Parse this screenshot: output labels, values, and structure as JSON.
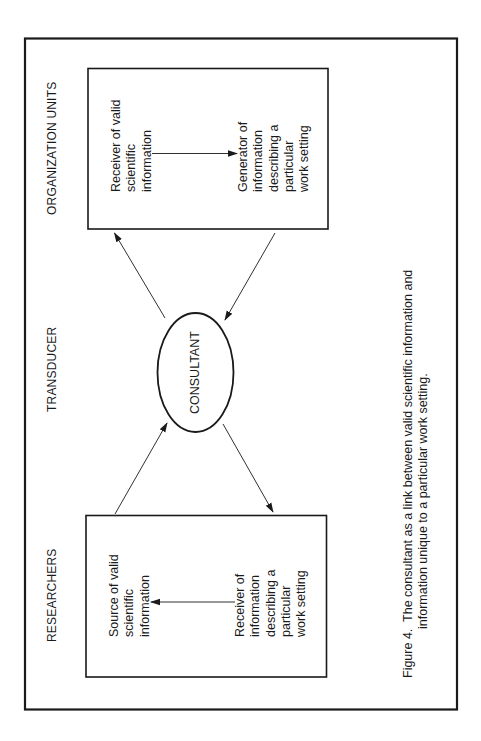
{
  "figure": {
    "orientation": "rotated 90° counter-clockwise",
    "sections": {
      "top": "ORGANIZATION UNITS",
      "middle": "TRANSDUCER",
      "bottom": "RESEARCHERS"
    },
    "consultant": {
      "label": "CONSULTANT"
    },
    "organization_box": {
      "receiver": {
        "lines": [
          "Receiver of valid",
          "scientific",
          "information"
        ]
      },
      "generator": {
        "lines": [
          "Generator of",
          "information",
          "describing a",
          "particular",
          "work setting"
        ]
      }
    },
    "researchers_box": {
      "source": {
        "lines": [
          "Source of valid",
          "scientific",
          "information"
        ]
      },
      "receiver": {
        "lines": [
          "Receiver of",
          "information",
          "describing a",
          "particular",
          "work setting"
        ]
      }
    },
    "caption": {
      "line1": "Figure 4.  The consultant as a link between valid scientific information and",
      "line2": "information unique to a particular work setting."
    },
    "colors": {
      "ink": "#1a1a1a",
      "background": "#ffffff"
    }
  }
}
